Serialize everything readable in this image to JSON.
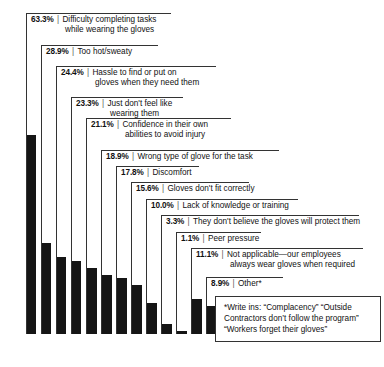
{
  "chart_data": {
    "type": "bar",
    "title": "",
    "subtitle": "",
    "xlabel": "",
    "ylabel": "",
    "grid": false,
    "legend_position": "none",
    "ylim": [
      0,
      63.3
    ],
    "value_suffix": "%",
    "categories": [
      "Difficulty completing tasks while wearing the gloves",
      "Too hot/sweaty",
      "Hassle to find or put on gloves when they need them",
      "Just don't feel like wearing them",
      "Confidence in their own abilities to avoid injury",
      "Wrong type of glove for the task",
      "Discomfort",
      "Gloves don't fit correctly",
      "Lack of knowledge or training",
      "They don't believe the gloves will protect them",
      "Peer pressure",
      "Not applicable—our employees always wear gloves when required",
      "Other*"
    ],
    "values": [
      63.3,
      28.9,
      24.4,
      23.3,
      21.1,
      18.9,
      17.8,
      15.6,
      10.0,
      3.3,
      1.1,
      11.1,
      8.9
    ],
    "bar_color": "#151515"
  },
  "items": [
    {
      "pct": "63.3%",
      "sep": "|",
      "line1": "Difficulty completing tasks",
      "line2": "while wearing the gloves"
    },
    {
      "pct": "28.9%",
      "sep": "|",
      "line1": "Too hot/sweaty",
      "line2": ""
    },
    {
      "pct": "24.4%",
      "sep": "|",
      "line1": "Hassle to find or put on",
      "line2": "gloves when they need them"
    },
    {
      "pct": "23.3%",
      "sep": "|",
      "line1": "Just don't feel like",
      "line2": "wearing them"
    },
    {
      "pct": "21.1%",
      "sep": "|",
      "line1": "Confidence in their own",
      "line2": "abilities to avoid injury"
    },
    {
      "pct": "18.9%",
      "sep": "|",
      "line1": "Wrong type of glove for the task",
      "line2": ""
    },
    {
      "pct": "17.8%",
      "sep": "|",
      "line1": "Discomfort",
      "line2": ""
    },
    {
      "pct": "15.6%",
      "sep": "|",
      "line1": "Gloves don't fit correctly",
      "line2": ""
    },
    {
      "pct": "10.0%",
      "sep": "|",
      "line1": "Lack of knowledge or training",
      "line2": ""
    },
    {
      "pct": "3.3%",
      "sep": "|",
      "line1": "They don't believe the gloves will protect them",
      "line2": ""
    },
    {
      "pct": "1.1%",
      "sep": "|",
      "line1": "Peer pressure",
      "line2": ""
    },
    {
      "pct": "11.1%",
      "sep": "|",
      "line1": "Not applicable—our employees",
      "line2": "always wear gloves when required"
    },
    {
      "pct": "8.9%",
      "sep": "|",
      "line1": "Other*",
      "line2": ""
    }
  ],
  "writeins": {
    "line1": "*Write ins: “Complacency” “Outside",
    "line2": "Contractors don’t follow the program”",
    "line3": "“Workers forget their gloves”"
  }
}
